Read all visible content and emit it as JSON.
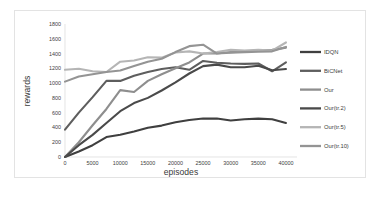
{
  "chart_data": {
    "type": "line",
    "title": "",
    "xlabel": "episodes",
    "ylabel": "rewards",
    "xlim": [
      0,
      42000
    ],
    "ylim": [
      0,
      1800
    ],
    "grid": false,
    "legend_position": "right",
    "xticks": [
      0,
      5000,
      10000,
      15000,
      20000,
      25000,
      30000,
      35000,
      40000
    ],
    "xtick_labels": [
      "0",
      "5000",
      "10000",
      "15000",
      "20000",
      "25000",
      "30000",
      "35000",
      "40000"
    ],
    "yticks": [
      0,
      200,
      400,
      600,
      800,
      1000,
      1200,
      1400,
      1600,
      1800
    ],
    "ytick_labels": [
      "0",
      "200",
      "400",
      "600",
      "800",
      "1000",
      "1200",
      "1400",
      "1600",
      "1800"
    ],
    "x": [
      0,
      2500,
      5000,
      7500,
      10000,
      12500,
      15000,
      17500,
      20000,
      22500,
      25000,
      27500,
      30000,
      32500,
      35000,
      37500,
      40000
    ],
    "series": [
      {
        "name": "IDQN",
        "color": "#3f3f3f",
        "width": 2.1,
        "values": [
          0,
          75,
          160,
          270,
          300,
          345,
          395,
          425,
          470,
          500,
          520,
          520,
          495,
          510,
          520,
          510,
          460
        ]
      },
      {
        "name": "BiCNet",
        "color": "#5e5e5e",
        "width": 2.1,
        "values": [
          370,
          600,
          810,
          1030,
          1030,
          1100,
          1150,
          1190,
          1215,
          1180,
          1300,
          1275,
          1265,
          1260,
          1265,
          1160,
          1280
        ]
      },
      {
        "name": "Our",
        "color": "#8e8e8e",
        "width": 2.1,
        "values": [
          0,
          200,
          430,
          650,
          905,
          880,
          1030,
          1120,
          1200,
          1280,
          1400,
          1400,
          1420,
          1430,
          1440,
          1450,
          1480
        ]
      },
      {
        "name": "Our(tr.2)",
        "color": "#4a4a4a",
        "width": 2.1,
        "values": [
          0,
          160,
          300,
          460,
          620,
          730,
          800,
          900,
          1010,
          1130,
          1230,
          1250,
          1215,
          1215,
          1235,
          1175,
          1190
        ]
      },
      {
        "name": "Our(tr.5)",
        "color": "#b5b5b5",
        "width": 2.1,
        "values": [
          1180,
          1195,
          1160,
          1150,
          1290,
          1305,
          1350,
          1345,
          1415,
          1430,
          1400,
          1420,
          1450,
          1440,
          1450,
          1440,
          1550
        ]
      },
      {
        "name": "Our(tr.10)",
        "color": "#949494",
        "width": 2.1,
        "values": [
          1020,
          1090,
          1120,
          1150,
          1170,
          1230,
          1290,
          1330,
          1420,
          1500,
          1520,
          1400,
          1410,
          1420,
          1425,
          1430,
          1490
        ]
      }
    ]
  },
  "legend": {
    "items": [
      {
        "label": "IDQN",
        "color": "#3f3f3f"
      },
      {
        "label": "BiCNet",
        "color": "#5e5e5e"
      },
      {
        "label": "Our",
        "color": "#8e8e8e"
      },
      {
        "label": "Our(tr.2)",
        "color": "#4a4a4a"
      },
      {
        "label": "Our(tr.5)",
        "color": "#b5b5b5"
      },
      {
        "label": "Our(tr.10)",
        "color": "#949494"
      }
    ]
  },
  "colors": {
    "background": "#ffffff",
    "frame_border": "#e3e3e3",
    "axis": "#d9d9d9",
    "tick_text": "#404040",
    "title_text": "#3a3a3a"
  }
}
